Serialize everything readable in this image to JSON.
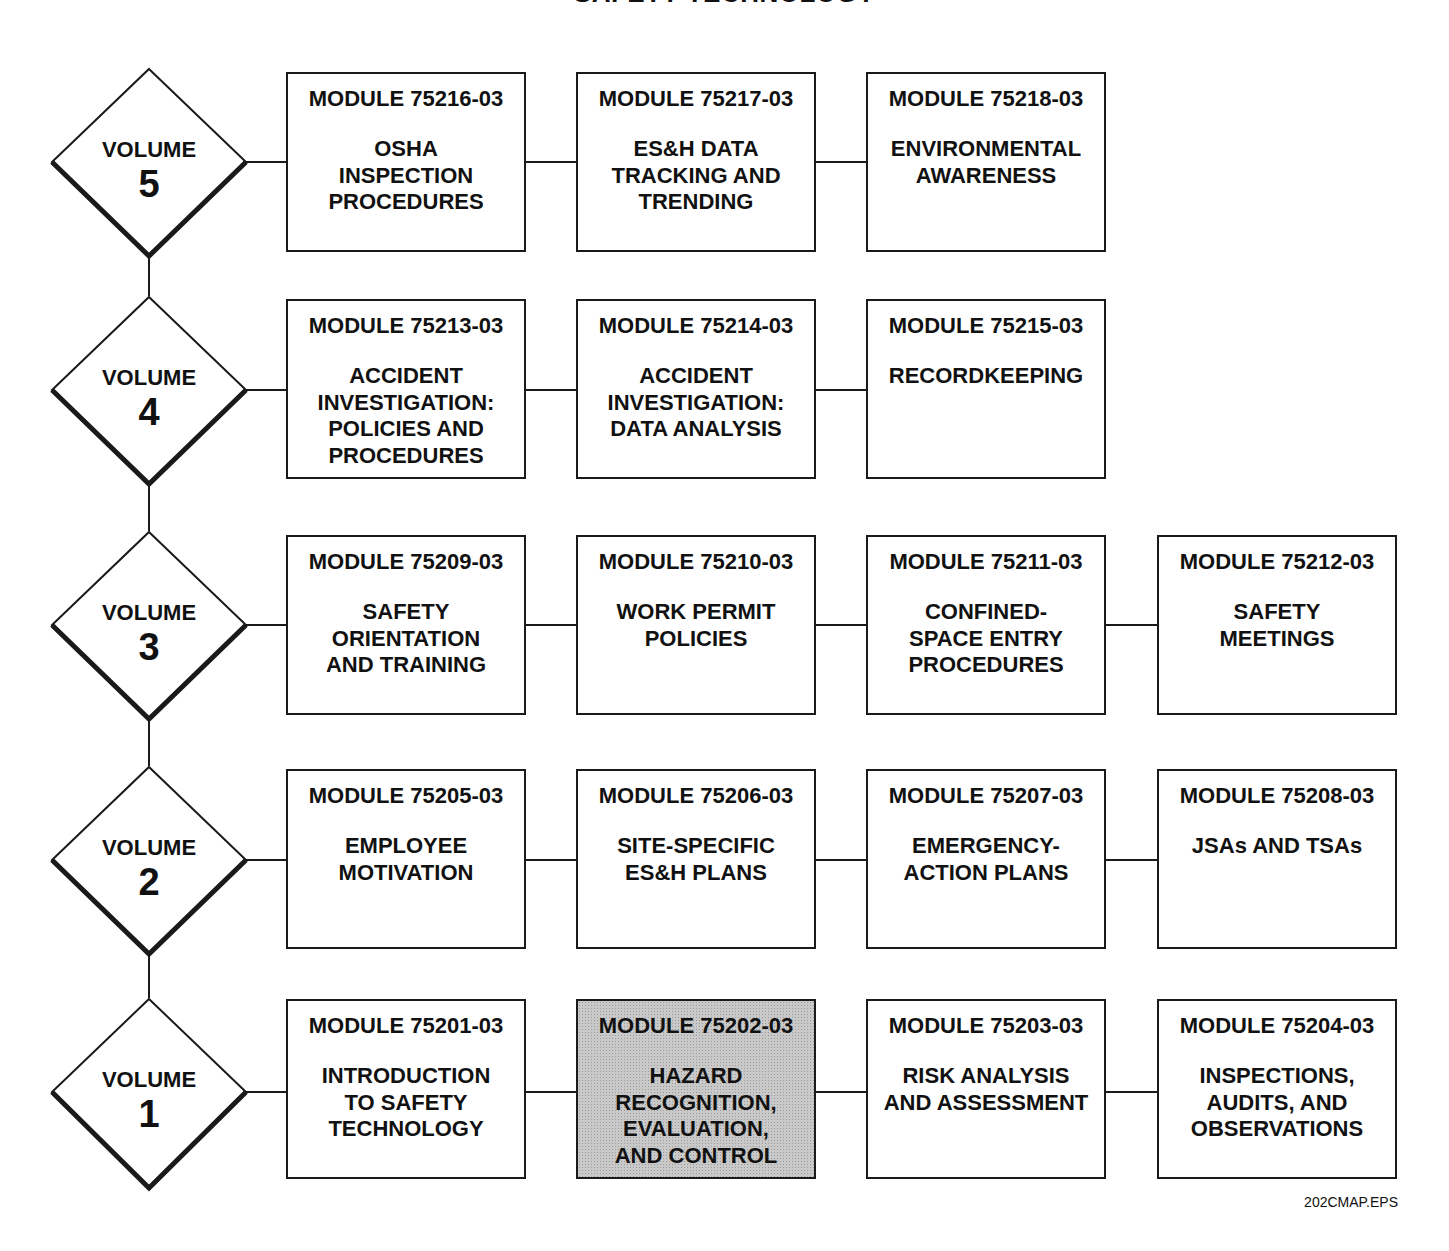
{
  "title": "SAFETY TECHNOLOGY",
  "footer_label": "202CMAP.EPS",
  "volumes": [
    {
      "label": "VOLUME",
      "number": "5",
      "modules": [
        {
          "code": "MODULE 75216-03",
          "name": "OSHA\nINSPECTION\nPROCEDURES"
        },
        {
          "code": "MODULE 75217-03",
          "name": "ES&H DATA\nTRACKING AND\nTRENDING"
        },
        {
          "code": "MODULE 75218-03",
          "name": "ENVIRONMENTAL\nAWARENESS"
        }
      ]
    },
    {
      "label": "VOLUME",
      "number": "4",
      "modules": [
        {
          "code": "MODULE 75213-03",
          "name": "ACCIDENT\nINVESTIGATION:\nPOLICIES AND\nPROCEDURES"
        },
        {
          "code": "MODULE 75214-03",
          "name": "ACCIDENT\nINVESTIGATION:\nDATA ANALYSIS"
        },
        {
          "code": "MODULE 75215-03",
          "name": "RECORDKEEPING"
        }
      ]
    },
    {
      "label": "VOLUME",
      "number": "3",
      "modules": [
        {
          "code": "MODULE 75209-03",
          "name": "SAFETY\nORIENTATION\nAND TRAINING"
        },
        {
          "code": "MODULE 75210-03",
          "name": "WORK PERMIT\nPOLICIES"
        },
        {
          "code": "MODULE 75211-03",
          "name": "CONFINED-\nSPACE ENTRY\nPROCEDURES"
        },
        {
          "code": "MODULE 75212-03",
          "name": "SAFETY\nMEETINGS"
        }
      ]
    },
    {
      "label": "VOLUME",
      "number": "2",
      "modules": [
        {
          "code": "MODULE 75205-03",
          "name": "EMPLOYEE\nMOTIVATION"
        },
        {
          "code": "MODULE 75206-03",
          "name": "SITE-SPECIFIC\nES&H PLANS"
        },
        {
          "code": "MODULE 75207-03",
          "name": "EMERGENCY-\nACTION PLANS"
        },
        {
          "code": "MODULE 75208-03",
          "name": "JSAs AND TSAs"
        }
      ]
    },
    {
      "label": "VOLUME",
      "number": "1",
      "modules": [
        {
          "code": "MODULE 75201-03",
          "name": "INTRODUCTION\nTO SAFETY\nTECHNOLOGY"
        },
        {
          "code": "MODULE 75202-03",
          "name": "HAZARD\nRECOGNITION,\nEVALUATION,\nAND CONTROL",
          "highlighted": true
        },
        {
          "code": "MODULE 75203-03",
          "name": "RISK ANALYSIS\nAND ASSESSMENT"
        },
        {
          "code": "MODULE 75204-03",
          "name": "INSPECTIONS,\nAUDITS, AND\nOBSERVATIONS"
        }
      ]
    }
  ]
}
